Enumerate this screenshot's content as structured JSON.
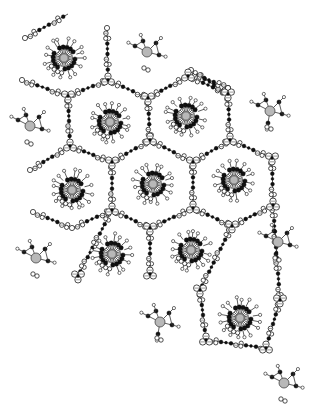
{
  "figure": {
    "type": "crystal-packing-diagram",
    "width": 313,
    "height": 405,
    "colors": {
      "background": "#ffffff",
      "carbon": "#111111",
      "hydrogen": "#ffffff",
      "oxygen": "#ffffff",
      "metal": "#b8b8b8",
      "bond": "#333333"
    }
  },
  "macrocycles": [
    {
      "x": 64,
      "y": 58
    },
    {
      "x": 110,
      "y": 122
    },
    {
      "x": 186,
      "y": 116
    },
    {
      "x": 72,
      "y": 190
    },
    {
      "x": 153,
      "y": 184
    },
    {
      "x": 234,
      "y": 180
    },
    {
      "x": 112,
      "y": 254
    },
    {
      "x": 191,
      "y": 250
    },
    {
      "x": 240,
      "y": 318
    }
  ],
  "small_complexes": [
    {
      "x": 147,
      "y": 52
    },
    {
      "x": 270,
      "y": 111
    },
    {
      "x": 30,
      "y": 126
    },
    {
      "x": 278,
      "y": 242
    },
    {
      "x": 36,
      "y": 258
    },
    {
      "x": 160,
      "y": 322
    },
    {
      "x": 284,
      "y": 383
    }
  ],
  "nodes": [
    {
      "x": 68,
      "y": 96
    },
    {
      "x": 108,
      "y": 80
    },
    {
      "x": 148,
      "y": 98
    },
    {
      "x": 188,
      "y": 76
    },
    {
      "x": 228,
      "y": 94
    },
    {
      "x": 70,
      "y": 146
    },
    {
      "x": 112,
      "y": 162
    },
    {
      "x": 150,
      "y": 140
    },
    {
      "x": 193,
      "y": 162
    },
    {
      "x": 230,
      "y": 140
    },
    {
      "x": 272,
      "y": 158
    },
    {
      "x": 112,
      "y": 210
    },
    {
      "x": 150,
      "y": 228
    },
    {
      "x": 193,
      "y": 208
    },
    {
      "x": 232,
      "y": 226
    },
    {
      "x": 273,
      "y": 205
    },
    {
      "x": 78,
      "y": 276
    },
    {
      "x": 150,
      "y": 274
    },
    {
      "x": 200,
      "y": 290
    },
    {
      "x": 206,
      "y": 340
    },
    {
      "x": 280,
      "y": 300
    },
    {
      "x": 266,
      "y": 348
    }
  ],
  "chains": [
    [
      0,
      1
    ],
    [
      1,
      2
    ],
    [
      2,
      3
    ],
    [
      3,
      4
    ],
    [
      0,
      5
    ],
    [
      2,
      7
    ],
    [
      4,
      9
    ],
    [
      5,
      6
    ],
    [
      6,
      7
    ],
    [
      7,
      8
    ],
    [
      8,
      9
    ],
    [
      9,
      10
    ],
    [
      6,
      11
    ],
    [
      8,
      13
    ],
    [
      10,
      15
    ],
    [
      11,
      12
    ],
    [
      12,
      13
    ],
    [
      13,
      14
    ],
    [
      14,
      15
    ],
    [
      11,
      16
    ],
    [
      12,
      17
    ],
    [
      14,
      18
    ],
    [
      18,
      19
    ],
    [
      19,
      21
    ],
    [
      15,
      20
    ],
    [
      20,
      21
    ]
  ],
  "terminal_chains": [
    {
      "from": {
        "x": 25,
        "y": 38
      },
      "to": {
        "x": 68,
        "y": 14
      }
    },
    {
      "from": {
        "x": 22,
        "y": 80
      },
      "to": {
        "x": 68,
        "y": 96
      }
    },
    {
      "from": {
        "x": 107,
        "y": 28
      },
      "to": {
        "x": 108,
        "y": 80
      }
    },
    {
      "from": {
        "x": 191,
        "y": 70
      },
      "to": {
        "x": 228,
        "y": 94
      }
    },
    {
      "from": {
        "x": 228,
        "y": 88
      },
      "to": {
        "x": 190,
        "y": 72
      }
    },
    {
      "from": {
        "x": 30,
        "y": 170
      },
      "to": {
        "x": 70,
        "y": 146
      }
    },
    {
      "from": {
        "x": 33,
        "y": 212
      },
      "to": {
        "x": 72,
        "y": 228
      }
    },
    {
      "from": {
        "x": 72,
        "y": 228
      },
      "to": {
        "x": 112,
        "y": 210
      }
    },
    {
      "from": {
        "x": 228,
        "y": 88
      },
      "to": {
        "x": 228,
        "y": 94
      }
    }
  ]
}
